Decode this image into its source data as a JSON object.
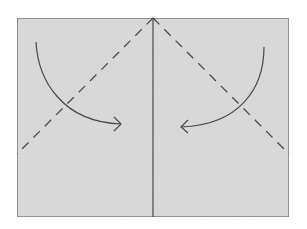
{
  "diagram": {
    "type": "origami-fold-instruction",
    "colors": {
      "background": "#ffffff",
      "paper": "#d9d9d9",
      "paper_border": "#7a7a7a",
      "line": "#4a4a4a"
    },
    "paper": {
      "x": 17,
      "y": 18,
      "width": 272,
      "height": 199
    },
    "center_crease": {
      "x": 153,
      "y1": 18,
      "y2": 217
    },
    "fold_lines": [
      {
        "name": "left-valley-fold",
        "x1": 153,
        "y1": 18,
        "x2": 17,
        "y2": 154,
        "style": "dashed"
      },
      {
        "name": "right-valley-fold",
        "x1": 153,
        "y1": 18,
        "x2": 289,
        "y2": 154,
        "style": "dashed"
      }
    ],
    "arrows": [
      {
        "name": "left-fold-arrow",
        "direction": "curved-right",
        "from": [
          36,
          42
        ],
        "to": [
          121,
          124
        ]
      },
      {
        "name": "right-fold-arrow",
        "direction": "curved-left",
        "from": [
          264,
          47
        ],
        "to": [
          181,
          127
        ]
      }
    ]
  }
}
